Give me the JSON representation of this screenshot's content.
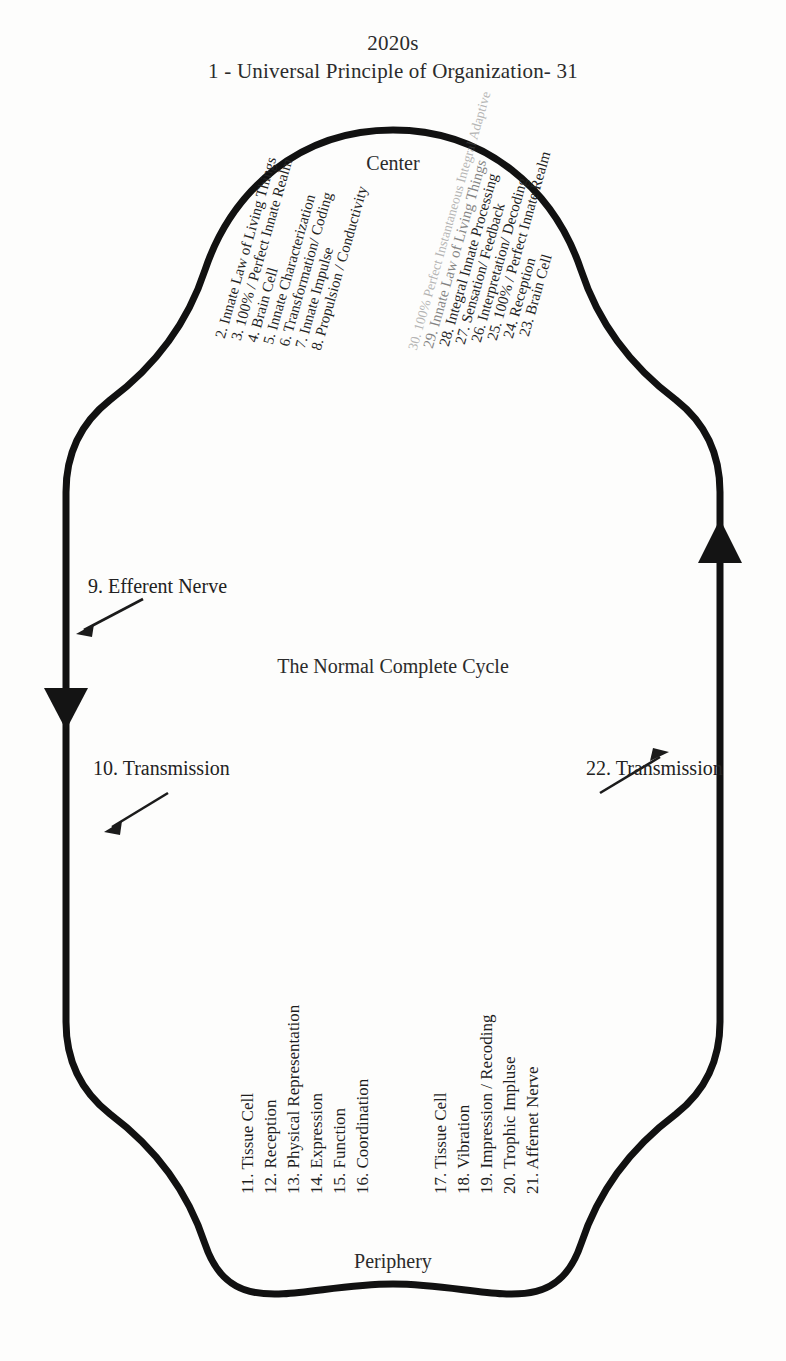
{
  "title": {
    "decade": "2020s",
    "heading": "1 -  Universal Principle of Organization- 31"
  },
  "poles": {
    "top": "Center",
    "bottom": "Periphery",
    "center_caption": "The Normal Complete Cycle"
  },
  "stage_labels": {
    "efferent_nerve": "9. Efferent Nerve",
    "transmission_down": "10. Transmission",
    "transmission_up": "22. Transmission"
  },
  "descending_steps": [
    "2. Innate Law of Living Things",
    "3. 100% / Perfect Innate Realm",
    "4. Brain Cell",
    "5. Innate Characterization",
    "6. Transformation/ Coding",
    "7. Innate Impulse",
    "8. Propulsion / Conductivity"
  ],
  "ascending_steps": [
    "23. Brain Cell",
    "24. Reception",
    "25. 100% / Perfect Innate Realm",
    "26. Interpretation/ Decoding",
    "27. Sensation/ Feedback",
    "28. Integral Innate Processing",
    "29. Innate Law of Living Things",
    "30. 100% Perfect Instantaneous Integral Adaptive"
  ],
  "peripheral_steps_left": [
    "11. Tissue Cell",
    "12. Reception",
    "13. Physical Representation",
    "14. Expression",
    "15. Function",
    "16. Coordination"
  ],
  "peripheral_steps_right": [
    "17. Tissue Cell",
    "18. Vibration",
    "19. Impression / Recoding",
    "20. Trophic Impluse",
    "21. Affernet Nerve"
  ],
  "colors": {
    "ink": "#1a1a1a",
    "paper": "#fdfdfc"
  },
  "icons": {
    "arrow_down": "downward-arrowhead",
    "arrow_up": "upward-arrowhead",
    "pointer_efferent": "pointer-arrow",
    "pointer_transmission_down": "pointer-arrow",
    "pointer_transmission_up": "pointer-arrow"
  }
}
